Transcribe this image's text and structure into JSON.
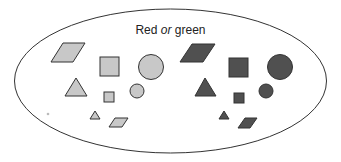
{
  "diagram": {
    "title_parts": [
      "Red",
      "or",
      "green"
    ],
    "set_label": "Red or green",
    "colors": {
      "light_fill": "#c8c8c8",
      "dark_fill": "#505050",
      "stroke": "#333333",
      "outline": "#333333"
    },
    "groups": [
      {
        "name": "light-group",
        "shapes": [
          "large parallelogram",
          "large square",
          "large circle",
          "large triangle",
          "small square",
          "small circle",
          "small triangle",
          "small parallelogram"
        ]
      },
      {
        "name": "dark-group",
        "shapes": [
          "large parallelogram",
          "large square",
          "large circle",
          "large triangle",
          "small square",
          "small circle",
          "small triangle",
          "small parallelogram"
        ]
      }
    ]
  }
}
